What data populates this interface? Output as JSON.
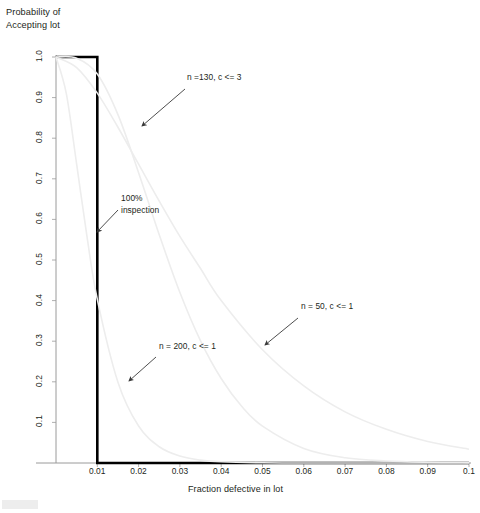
{
  "chart_data": {
    "type": "line",
    "title": "Probability of\nAccepting lot",
    "xlabel": "Fraction defective in lot",
    "ylabel": "Probability of Accepting lot",
    "xlim": [
      0,
      0.1
    ],
    "ylim": [
      0,
      1.0
    ],
    "grid": false,
    "legend_position": "inline-annotations",
    "xticks": [
      "0.01",
      "0.02",
      "0.03",
      "0.04",
      "0.05",
      "0.06",
      "0.07",
      "0.08",
      "0.09",
      "0.1"
    ],
    "xtick_values": [
      0.01,
      0.02,
      0.03,
      0.04,
      0.05,
      0.06,
      0.07,
      0.08,
      0.09,
      0.1
    ],
    "yticks": [
      "1.0",
      "0.9",
      "0.8",
      "0.7",
      "0.6",
      "0.5",
      "0.4",
      "0.3",
      "0.2",
      "0.1"
    ],
    "ytick_values": [
      1.0,
      0.9,
      0.8,
      0.7,
      0.6,
      0.5,
      0.4,
      0.3,
      0.2,
      0.1
    ],
    "series": [
      {
        "name": "100% inspection",
        "style": "step",
        "color": "#000000",
        "width": 2.6,
        "x": [
          0,
          0.01,
          0.01,
          0.1
        ],
        "values": [
          1.0,
          1.0,
          0.0,
          0.0
        ]
      },
      {
        "name": "n =130, c <= 3",
        "style": "oc-curve",
        "color": "#ededed",
        "width": 1.6,
        "n": 130,
        "c": 3,
        "x": [
          0,
          0.005,
          0.01,
          0.015,
          0.02,
          0.025,
          0.03,
          0.035,
          0.04,
          0.045,
          0.05,
          0.06,
          0.07,
          0.08,
          0.09,
          0.1
        ],
        "values": [
          1.0,
          0.997,
          0.958,
          0.858,
          0.715,
          0.562,
          0.42,
          0.301,
          0.208,
          0.139,
          0.091,
          0.036,
          0.013,
          0.005,
          0.002,
          0.001
        ]
      },
      {
        "name": "n = 200, c <= 1",
        "style": "oc-curve",
        "color": "#ededed",
        "width": 1.6,
        "n": 200,
        "c": 1,
        "x": [
          0,
          0.0025,
          0.005,
          0.0075,
          0.01,
          0.015,
          0.02,
          0.025,
          0.03,
          0.035,
          0.04,
          0.05,
          0.06,
          0.08,
          0.1
        ],
        "values": [
          1.0,
          0.91,
          0.736,
          0.558,
          0.403,
          0.199,
          0.091,
          0.04,
          0.017,
          0.007,
          0.003,
          0.0005,
          0.0001,
          0.0,
          0.0
        ]
      },
      {
        "name": "n = 50, c <= 1",
        "style": "oc-curve",
        "color": "#ededed",
        "width": 1.6,
        "n": 50,
        "c": 1,
        "x": [
          0,
          0.005,
          0.01,
          0.015,
          0.02,
          0.025,
          0.03,
          0.035,
          0.04,
          0.05,
          0.06,
          0.07,
          0.08,
          0.09,
          0.1
        ],
        "values": [
          1.0,
          0.974,
          0.911,
          0.827,
          0.736,
          0.645,
          0.558,
          0.479,
          0.4,
          0.279,
          0.19,
          0.126,
          0.083,
          0.053,
          0.034
        ]
      }
    ],
    "annotations": [
      {
        "id": "annot-n130",
        "text": "n =130, c <= 3",
        "label_x": 187,
        "label_y": 81,
        "arrow_from_x": 185,
        "arrow_from_y": 89,
        "arrow_to_x": 142,
        "arrow_to_y": 126
      },
      {
        "id": "annot-inspection",
        "text": "100%\ninspection",
        "label_x": 121,
        "label_y": 202,
        "arrow_from_x": 118,
        "arrow_from_y": 210,
        "arrow_to_x": 97,
        "arrow_to_y": 232
      },
      {
        "id": "annot-n50",
        "text": "n = 50, c <= 1",
        "label_x": 301,
        "label_y": 310,
        "arrow_from_x": 298,
        "arrow_from_y": 318,
        "arrow_to_x": 265,
        "arrow_to_y": 345
      },
      {
        "id": "annot-n200",
        "text": "n = 200, c <= 1",
        "label_x": 159,
        "label_y": 350,
        "arrow_from_x": 156,
        "arrow_from_y": 357,
        "arrow_to_x": 129,
        "arrow_to_y": 381
      }
    ],
    "colors": {
      "axis": "#9a9a9a",
      "curve": "#ededed",
      "emphasis": "#000000",
      "text": "#231f20",
      "arrow": "#3a3a3a"
    }
  }
}
